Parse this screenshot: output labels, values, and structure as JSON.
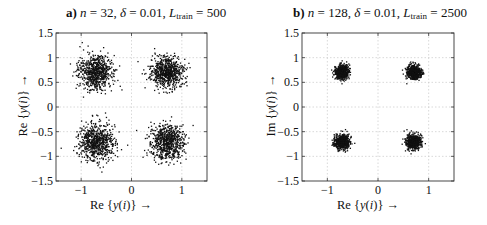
{
  "chart_data": [
    {
      "type": "scatter",
      "panel_label": "a)",
      "title": "a) n = 32, δ = 0.01, L_train = 500",
      "title_parts": {
        "label": "a)",
        "n": "32",
        "delta": "0.01",
        "L_train": "500"
      },
      "xlabel": "Re{y(i)} →",
      "ylabel": "Re{y(i)} →",
      "xlim": [
        -1.5,
        1.5
      ],
      "ylim": [
        -1.5,
        1.5
      ],
      "xticks": [
        -1,
        0,
        1
      ],
      "yticks": [
        -1.5,
        -1,
        -0.5,
        0,
        0.5,
        1,
        1.5
      ],
      "xtick_labels": [
        "−1",
        "0",
        "1"
      ],
      "ytick_labels": [
        "−1.5",
        "−1",
        "−0.5",
        "0",
        "0.5",
        "1",
        "1.5"
      ],
      "grid": true,
      "grid_lines": [
        -1,
        -0.5,
        0,
        0.5,
        1
      ],
      "clusters": [
        {
          "x": -0.707,
          "y": 0.707,
          "spread": 0.17
        },
        {
          "x": 0.707,
          "y": 0.707,
          "spread": 0.16
        },
        {
          "x": -0.707,
          "y": -0.707,
          "spread": 0.18
        },
        {
          "x": 0.707,
          "y": -0.707,
          "spread": 0.17
        }
      ],
      "points_per_cluster": 700,
      "marker_color": "#111111",
      "seed": 7
    },
    {
      "type": "scatter",
      "panel_label": "b)",
      "title": "b) n = 128, δ = 0.01, L_train = 2500",
      "title_parts": {
        "label": "b)",
        "n": "128",
        "delta": "0.01",
        "L_train": "2500"
      },
      "xlabel": "Re{y(i)} →",
      "ylabel": "Im{y(i)} →",
      "xlim": [
        -1.5,
        1.5
      ],
      "ylim": [
        -1.5,
        1.5
      ],
      "xticks": [
        -1,
        0,
        1
      ],
      "yticks": [
        -1.5,
        -1,
        -0.5,
        0,
        0.5,
        1,
        1.5
      ],
      "xtick_labels": [
        "−1",
        "0",
        "1"
      ],
      "ytick_labels": [
        "−1.5",
        "−1",
        "−0.5",
        "0",
        "0.5",
        "1",
        "1.5"
      ],
      "grid": true,
      "grid_lines": [
        -1,
        -0.5,
        0,
        0.5,
        1
      ],
      "clusters": [
        {
          "x": -0.707,
          "y": 0.707,
          "spread": 0.07
        },
        {
          "x": 0.707,
          "y": 0.707,
          "spread": 0.07
        },
        {
          "x": -0.707,
          "y": -0.707,
          "spread": 0.075
        },
        {
          "x": 0.707,
          "y": -0.707,
          "spread": 0.075
        }
      ],
      "points_per_cluster": 600,
      "marker_color": "#111111",
      "seed": 13
    }
  ]
}
